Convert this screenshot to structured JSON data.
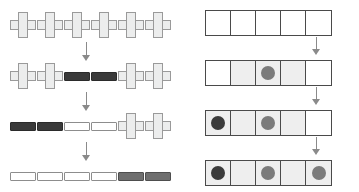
{
  "figure": {
    "title": "",
    "background_color": "#ffffff",
    "width": 359,
    "height": 192,
    "panels": [
      {
        "id": "left",
        "name": "cross-bar-sequence",
        "x": 0,
        "width": 180,
        "description": "Four stages of a row of six units changing from cross shapes to bars",
        "rows": [
          {
            "index": 1,
            "y": 12,
            "items": [
              {
                "shape": "cross",
                "fill": "#eceded",
                "stroke": "#9a9a9a"
              },
              {
                "shape": "cross",
                "fill": "#eceded",
                "stroke": "#9a9a9a"
              },
              {
                "shape": "cross",
                "fill": "#eceded",
                "stroke": "#9a9a9a"
              },
              {
                "shape": "cross",
                "fill": "#eceded",
                "stroke": "#9a9a9a"
              },
              {
                "shape": "cross",
                "fill": "#eceded",
                "stroke": "#9a9a9a"
              },
              {
                "shape": "cross",
                "fill": "#eceded",
                "stroke": "#9a9a9a"
              }
            ]
          },
          {
            "index": 2,
            "y": 63,
            "items": [
              {
                "shape": "cross",
                "fill": "#eceded",
                "stroke": "#9a9a9a"
              },
              {
                "shape": "cross",
                "fill": "#eceded",
                "stroke": "#9a9a9a"
              },
              {
                "shape": "bar",
                "fill": "#3a3a3a",
                "stroke": "#2b2b2b",
                "tone": "dark"
              },
              {
                "shape": "bar",
                "fill": "#3a3a3a",
                "stroke": "#2b2b2b",
                "tone": "dark"
              },
              {
                "shape": "cross",
                "fill": "#eceded",
                "stroke": "#9a9a9a"
              },
              {
                "shape": "cross",
                "fill": "#eceded",
                "stroke": "#9a9a9a"
              }
            ]
          },
          {
            "index": 3,
            "y": 113,
            "items": [
              {
                "shape": "bar",
                "fill": "#3a3a3a",
                "stroke": "#2b2b2b",
                "tone": "dark"
              },
              {
                "shape": "bar",
                "fill": "#3a3a3a",
                "stroke": "#2b2b2b",
                "tone": "dark"
              },
              {
                "shape": "bar",
                "fill": "#ffffff",
                "stroke": "#8d8d8d",
                "tone": "white"
              },
              {
                "shape": "bar",
                "fill": "#ffffff",
                "stroke": "#8d8d8d",
                "tone": "white"
              },
              {
                "shape": "cross",
                "fill": "#eceded",
                "stroke": "#9a9a9a"
              },
              {
                "shape": "cross",
                "fill": "#eceded",
                "stroke": "#9a9a9a"
              }
            ]
          },
          {
            "index": 4,
            "y": 163,
            "items": [
              {
                "shape": "bar",
                "fill": "#ffffff",
                "stroke": "#8d8d8d",
                "tone": "white"
              },
              {
                "shape": "bar",
                "fill": "#ffffff",
                "stroke": "#8d8d8d",
                "tone": "white"
              },
              {
                "shape": "bar",
                "fill": "#ffffff",
                "stroke": "#8d8d8d",
                "tone": "white"
              },
              {
                "shape": "bar",
                "fill": "#ffffff",
                "stroke": "#8d8d8d",
                "tone": "white"
              },
              {
                "shape": "bar",
                "fill": "#6e6e6e",
                "stroke": "#4e4e4e",
                "tone": "mid"
              },
              {
                "shape": "bar",
                "fill": "#6e6e6e",
                "stroke": "#4e4e4e",
                "tone": "mid"
              }
            ]
          }
        ],
        "arrows": [
          {
            "from_row": 1,
            "to_row": 2,
            "direction": "down",
            "x": 82,
            "y": 42,
            "length": 19
          },
          {
            "from_row": 2,
            "to_row": 3,
            "direction": "down",
            "x": 82,
            "y": 92,
            "length": 19
          },
          {
            "from_row": 3,
            "to_row": 4,
            "direction": "down",
            "x": 82,
            "y": 142,
            "length": 19
          }
        ]
      },
      {
        "id": "right",
        "name": "grid-dot-sequence",
        "x": 180,
        "width": 179,
        "description": "Four stages of a five-cell strip filling with shading and dots",
        "rows": [
          {
            "index": 1,
            "y": 10,
            "cells": [
              {
                "fill": "white",
                "dot": null
              },
              {
                "fill": "white",
                "dot": null
              },
              {
                "fill": "white",
                "dot": null
              },
              {
                "fill": "white",
                "dot": null
              },
              {
                "fill": "white",
                "dot": null
              }
            ]
          },
          {
            "index": 2,
            "y": 60,
            "cells": [
              {
                "fill": "white",
                "dot": null
              },
              {
                "fill": "shade",
                "dot": null
              },
              {
                "fill": "shade",
                "dot": "mid"
              },
              {
                "fill": "shade",
                "dot": null
              },
              {
                "fill": "white",
                "dot": null
              }
            ]
          },
          {
            "index": 3,
            "y": 110,
            "cells": [
              {
                "fill": "shade",
                "dot": "dark"
              },
              {
                "fill": "shade",
                "dot": null
              },
              {
                "fill": "shade",
                "dot": "mid"
              },
              {
                "fill": "shade",
                "dot": null
              },
              {
                "fill": "white",
                "dot": null
              }
            ]
          },
          {
            "index": 4,
            "y": 160,
            "cells": [
              {
                "fill": "shade",
                "dot": "dark"
              },
              {
                "fill": "shade",
                "dot": null
              },
              {
                "fill": "shade",
                "dot": "mid"
              },
              {
                "fill": "shade",
                "dot": null
              },
              {
                "fill": "shade",
                "dot": "mid"
              }
            ]
          }
        ],
        "arrows": [
          {
            "from_row": 1,
            "to_row": 2,
            "direction": "down",
            "x": 132,
            "y": 37,
            "length": 18
          },
          {
            "from_row": 2,
            "to_row": 3,
            "direction": "down",
            "x": 132,
            "y": 87,
            "length": 18
          },
          {
            "from_row": 3,
            "to_row": 4,
            "direction": "down",
            "x": 132,
            "y": 137,
            "length": 18
          }
        ],
        "colors": {
          "cell_border": "#4a4a4a",
          "cell_white": "#ffffff",
          "cell_shade": "#eeeeee",
          "dot_dark": "#3b3b3b",
          "dot_mid": "#7b7b7b"
        }
      }
    ],
    "arrow_color": "#8a8a8a"
  }
}
